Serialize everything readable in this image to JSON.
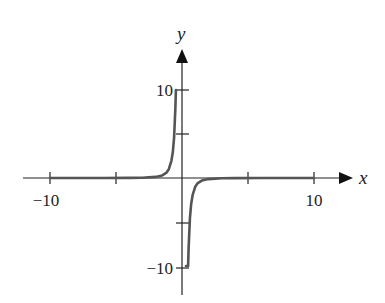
{
  "chart_data": {
    "type": "line",
    "title": "",
    "xlabel": "x",
    "ylabel": "y",
    "xlim": [
      -12,
      12.5
    ],
    "ylim": [
      -10,
      10
    ],
    "grid": false,
    "legend": null,
    "x_ticks": [
      -10,
      -5,
      5,
      10
    ],
    "x_tick_labels": [
      "−10",
      "",
      "",
      "10"
    ],
    "y_ticks": [
      10,
      5,
      -5,
      -10
    ],
    "y_tick_labels": [
      "10",
      "",
      "",
      "−10"
    ],
    "series": [
      {
        "name": "y = -1/x^3 (clipped at ±10)",
        "color": "#555555",
        "x": [
          -10,
          -8,
          -6,
          -4,
          -3,
          -2,
          -1.5,
          -1.2,
          -1,
          -0.8,
          -0.7,
          -0.6,
          -0.5,
          -0.464,
          0.464,
          0.5,
          0.6,
          0.7,
          0.8,
          1,
          1.2,
          1.5,
          2,
          3,
          4,
          6,
          8,
          10
        ],
        "values": [
          0.001,
          0.002,
          0.005,
          0.016,
          0.037,
          0.125,
          0.296,
          0.579,
          1.0,
          1.953,
          2.915,
          4.63,
          8.0,
          10.0,
          -10.0,
          -8.0,
          -4.63,
          -2.915,
          -1.953,
          -1.0,
          -0.579,
          -0.296,
          -0.125,
          -0.037,
          -0.016,
          -0.005,
          -0.002,
          -0.001
        ]
      }
    ]
  },
  "axes": {
    "x_label": "x",
    "y_label": "y",
    "x_tick_neg10": "−10",
    "x_tick_10": "10",
    "y_tick_10": "10",
    "y_tick_neg10": "−10"
  },
  "colors": {
    "axis": "#222222",
    "curve": "#555555",
    "background": "#ffffff"
  }
}
